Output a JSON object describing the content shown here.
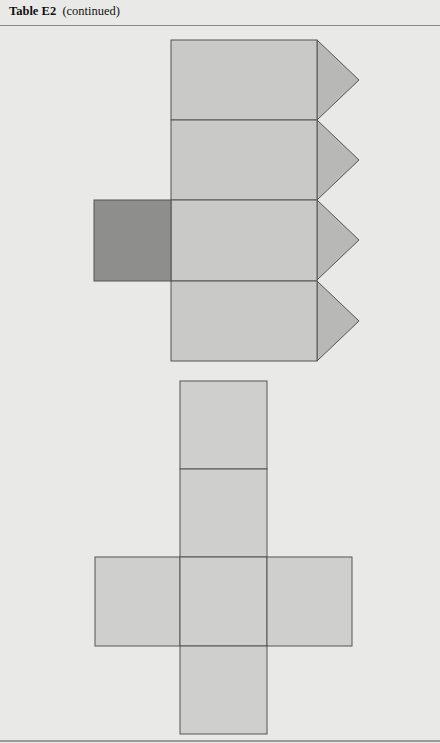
{
  "header": {
    "table_label": "Table E2",
    "continued_label": "(continued)"
  },
  "figures": {
    "prism_net": {
      "description": "Net of a triangular-topped prism: four stacked rectangles with triangular flaps and one dark square",
      "colors": {
        "face": "#c9c9c7",
        "flap": "#b8b8b6",
        "dark_face": "#8e8e8c",
        "stroke": "#555555"
      }
    },
    "cube_net": {
      "description": "Cross-shaped net of a rectangular box",
      "colors": {
        "face": "#cfcfcd",
        "stroke": "#555555"
      }
    }
  }
}
